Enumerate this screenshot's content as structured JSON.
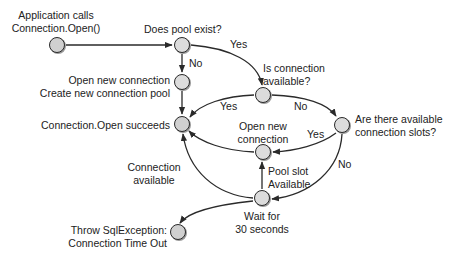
{
  "diagram": {
    "type": "flowchart",
    "colors": {
      "node_fill": "#d0d0d0",
      "node_stroke": "#2a2a2a",
      "edge": "#2a2a2a",
      "text": "#222222",
      "background": "#ffffff"
    },
    "nodes": [
      {
        "id": "start",
        "label_line1": "Application calls",
        "label_line2": "Connection.Open()"
      },
      {
        "id": "pool_exists",
        "label_line1": "Does pool exist?"
      },
      {
        "id": "create_pool",
        "label_line1": "Open new connection",
        "label_line2": "Create new connection pool"
      },
      {
        "id": "open_succeeds",
        "label_line1": "Connection.Open succeeds"
      },
      {
        "id": "conn_available",
        "label_line1": "Is connection",
        "label_line2": "available?"
      },
      {
        "id": "slots_available",
        "label_line1": "Are there available",
        "label_line2": "connection slots?"
      },
      {
        "id": "open_new_conn",
        "label_line1": "Open new",
        "label_line2": "connection"
      },
      {
        "id": "wait",
        "label_line1": "Wait for",
        "label_line2": "30 seconds"
      },
      {
        "id": "throw",
        "label_line1": "Throw SqlException:",
        "label_line2": "Connection Time Out"
      }
    ],
    "edges": [
      {
        "from": "start",
        "to": "pool_exists",
        "label": ""
      },
      {
        "from": "pool_exists",
        "to": "create_pool",
        "label": "No"
      },
      {
        "from": "pool_exists",
        "to": "conn_available",
        "label": "Yes"
      },
      {
        "from": "create_pool",
        "to": "open_succeeds",
        "label": ""
      },
      {
        "from": "conn_available",
        "to": "open_succeeds",
        "label": "Yes"
      },
      {
        "from": "conn_available",
        "to": "slots_available",
        "label": "No"
      },
      {
        "from": "slots_available",
        "to": "open_new_conn",
        "label": "Yes"
      },
      {
        "from": "slots_available",
        "to": "wait",
        "label": "No"
      },
      {
        "from": "open_new_conn",
        "to": "open_succeeds",
        "label": ""
      },
      {
        "from": "wait",
        "to": "open_new_conn",
        "label_line1": "Pool slot",
        "label_line2": "Available"
      },
      {
        "from": "wait",
        "to": "open_succeeds",
        "label_line1": "Connection",
        "label_line2": "available"
      },
      {
        "from": "wait",
        "to": "throw",
        "label": ""
      }
    ],
    "edge_labels": {
      "no_pool": "No",
      "yes_pool": "Yes",
      "yes_conn": "Yes",
      "no_conn": "No",
      "yes_slots": "Yes",
      "no_slots": "No",
      "pool_slot_1": "Pool slot",
      "pool_slot_2": "Available",
      "conn_avail_1": "Connection",
      "conn_avail_2": "available"
    }
  }
}
